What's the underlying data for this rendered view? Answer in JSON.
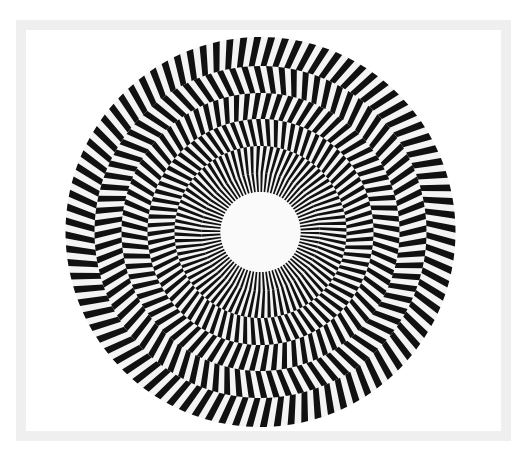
{
  "artwork": {
    "frame_color": "#efefef",
    "background": "#ffffff",
    "stripe_color": "#111111",
    "center": {
      "x": 260.5,
      "y": 232
    },
    "outer_radius": 195,
    "center_radius": 40,
    "rings": [
      {
        "outer": 195,
        "inner": 166,
        "stripes": 88,
        "tilt": 0.55
      },
      {
        "outer": 166,
        "inner": 139,
        "stripes": 84,
        "tilt": -0.55
      },
      {
        "outer": 139,
        "inner": 113,
        "stripes": 80,
        "tilt": 0.55
      },
      {
        "outer": 113,
        "inner": 86,
        "stripes": 80,
        "tilt": -0.5
      },
      {
        "outer": 86,
        "inner": 59,
        "stripes": 80,
        "tilt": 0.45
      },
      {
        "outer": 59,
        "inner": 40,
        "stripes": 80,
        "tilt": 0.0
      }
    ]
  }
}
